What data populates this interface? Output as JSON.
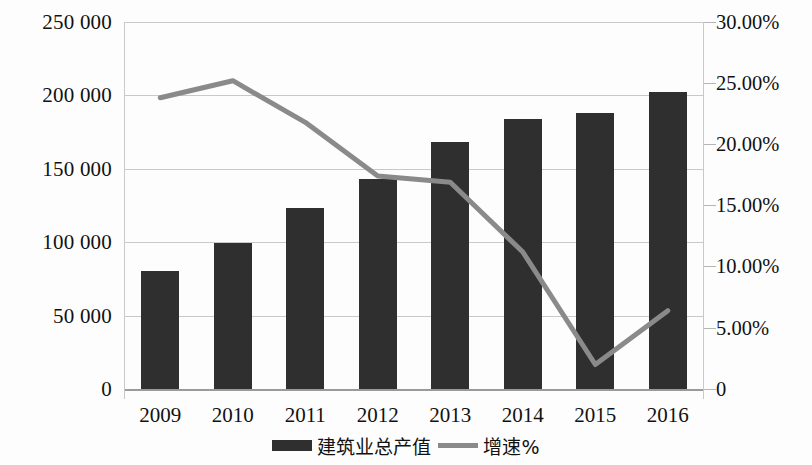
{
  "chart_data": {
    "type": "bar",
    "title": "",
    "xlabel": "",
    "ylabel": "",
    "categories": [
      "2009",
      "2010",
      "2011",
      "2012",
      "2013",
      "2014",
      "2015",
      "2016"
    ],
    "series": [
      {
        "name": "建筑业总产值",
        "type": "bar",
        "axis": "left",
        "color": "#2f2f2f",
        "values": [
          80700,
          99800,
          123000,
          143000,
          168000,
          184000,
          188000,
          202000
        ]
      },
      {
        "name": "增速%",
        "type": "line",
        "axis": "right",
        "color": "#8a8a8a",
        "values": [
          23.8,
          25.2,
          21.8,
          17.4,
          16.9,
          11.2,
          2.0,
          6.4
        ]
      }
    ],
    "left_axis": {
      "ticks": [
        "250 000",
        "200 000",
        "150 000",
        "100 000",
        "50 000",
        "0"
      ],
      "tick_values": [
        250000,
        200000,
        150000,
        100000,
        50000,
        0
      ],
      "ylim": [
        0,
        250000
      ]
    },
    "right_axis": {
      "ticks": [
        "30.00%",
        "25.00%",
        "20.00%",
        "15.00%",
        "10.00%",
        "5.00%",
        "0"
      ],
      "tick_values": [
        30,
        25,
        20,
        15,
        10,
        5,
        0
      ],
      "ylim": [
        0,
        30
      ]
    },
    "grid": true,
    "legend_position": "bottom-center",
    "legend": [
      "建筑业总产值",
      "增速%"
    ]
  },
  "colors": {
    "bar": "#2f2f2f",
    "line": "#8a8a8a",
    "grid": "#c9c9c9",
    "background": "#fdfdfd",
    "text": "#111111"
  }
}
